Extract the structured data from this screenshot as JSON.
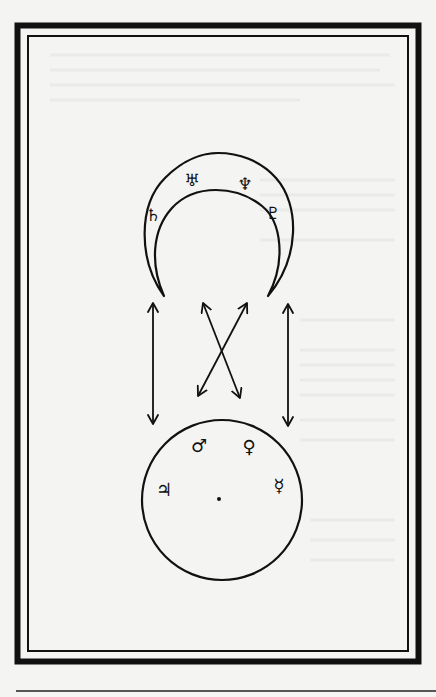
{
  "diagram": {
    "type": "astrological-correspondence",
    "colors": {
      "background": "#f4f4f2",
      "ink": "#111111",
      "ghost_text": "#e6e6e3"
    },
    "frame": {
      "outer_border": "thick",
      "inner_border": "thin"
    },
    "upper_figure": {
      "shape": "crescent",
      "planets": [
        {
          "name": "Saturn",
          "symbol": "♄"
        },
        {
          "name": "Uranus",
          "symbol": "♅"
        },
        {
          "name": "Neptune",
          "symbol": "♆"
        },
        {
          "name": "Pluto",
          "symbol": "♇"
        }
      ]
    },
    "lower_figure": {
      "shape": "circle",
      "center_mark": "point",
      "planets": [
        {
          "name": "Jupiter",
          "symbol": "♃"
        },
        {
          "name": "Mars",
          "symbol": "♂"
        },
        {
          "name": "Venus",
          "symbol": "♀"
        },
        {
          "name": "Mercury",
          "symbol": "☿"
        }
      ]
    },
    "connectors": [
      {
        "kind": "double-arrow",
        "orientation": "vertical",
        "side": "left"
      },
      {
        "kind": "double-arrow",
        "orientation": "vertical",
        "side": "right"
      },
      {
        "kind": "double-arrow",
        "orientation": "diagonal",
        "direction": "down-right"
      },
      {
        "kind": "double-arrow",
        "orientation": "diagonal",
        "direction": "down-left"
      }
    ]
  }
}
